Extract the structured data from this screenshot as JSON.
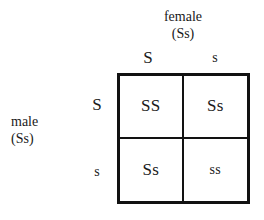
{
  "diagram": {
    "type": "punnett-square",
    "background_color": "#ffffff",
    "line_color": "#121212",
    "text_color": "#1a1a1a"
  },
  "parents": {
    "top": {
      "sex": "female",
      "genotype": "(Ss)",
      "alleles": [
        "S",
        "s"
      ]
    },
    "left": {
      "sex": "male",
      "genotype": "(Ss)",
      "alleles": [
        "S",
        "s"
      ]
    }
  },
  "axis_labels": {
    "columns": [
      {
        "allele": "S",
        "type": "dominant"
      },
      {
        "allele": "s",
        "type": "recessive"
      }
    ],
    "rows": [
      {
        "allele": "S",
        "type": "dominant"
      },
      {
        "allele": "s",
        "type": "recessive"
      }
    ]
  },
  "grid": {
    "rows": 2,
    "columns": 2,
    "cells": [
      [
        {
          "genotype": "SS",
          "type": "homozygous-dominant"
        },
        {
          "genotype": "Ss",
          "type": "heterozygous"
        }
      ],
      [
        {
          "genotype": "Ss",
          "type": "heterozygous"
        },
        {
          "genotype": "ss",
          "type": "homozygous-recessive"
        }
      ]
    ]
  }
}
